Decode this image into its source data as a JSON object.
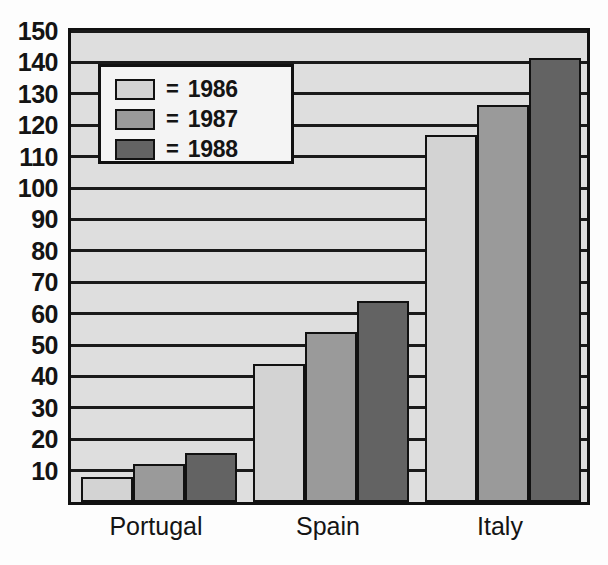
{
  "chart_data": {
    "type": "bar",
    "title": "",
    "subtitle": "",
    "xlabel": "",
    "ylabel": "",
    "categories": [
      "Portugal",
      "Spain",
      "Italy"
    ],
    "series": [
      {
        "name": "1986",
        "legend_label": "= 1986",
        "color": "#d3d3d3",
        "values": [
          8,
          44,
          117
        ]
      },
      {
        "name": "1987",
        "legend_label": "= 1987",
        "color": "#9a9a9a",
        "values": [
          12,
          54,
          126.5
        ]
      },
      {
        "name": "1988",
        "legend_label": "= 1988",
        "color": "#636363",
        "values": [
          15.5,
          64,
          141.5
        ]
      }
    ],
    "ylim": [
      0,
      150
    ],
    "yticks": [
      10,
      20,
      30,
      40,
      50,
      60,
      70,
      80,
      90,
      100,
      110,
      120,
      130,
      140,
      150
    ],
    "ytick_labels": [
      "10",
      "20",
      "30",
      "40",
      "50",
      "60",
      "70",
      "80",
      "90",
      "100",
      "110",
      "120",
      "130",
      "140",
      "150"
    ],
    "grid": true,
    "grid_axis": "y",
    "legend_position": "upper-left-inside",
    "plot_background": "#dedede",
    "axis_color": "#111111"
  },
  "legend": {
    "equals_sign": "=",
    "entries": [
      {
        "label": "1986",
        "color": "#d3d3d3"
      },
      {
        "label": "1987",
        "color": "#9a9a9a"
      },
      {
        "label": "1988",
        "color": "#636363"
      }
    ]
  }
}
